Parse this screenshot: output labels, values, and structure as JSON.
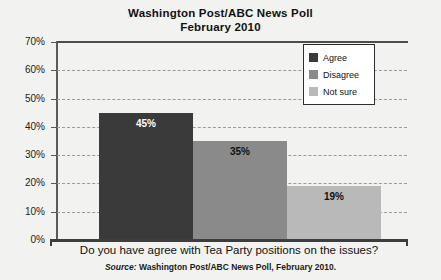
{
  "chart_data": {
    "type": "bar",
    "title": "Washington Post/ABC News Poll",
    "subtitle": "February 2010",
    "categories": [
      "Agree",
      "Disagree",
      "Not sure"
    ],
    "values": [
      45,
      35,
      19
    ],
    "value_labels": [
      "45%",
      "35%",
      "19%"
    ],
    "xlabel": "Do you have agree with Tea Party positions on the issues?",
    "ylabel": "",
    "ylim": [
      0,
      70
    ],
    "ytick_labels": [
      "70%",
      "60%",
      "50%",
      "40%",
      "30%",
      "20%",
      "10%",
      "0%"
    ],
    "ytick_values": [
      70,
      60,
      50,
      40,
      30,
      20,
      10,
      0
    ],
    "grid": "horizontal-dashed",
    "legend_position": "top-right",
    "series_colors": [
      "#3a3a3a",
      "#8a8a8a",
      "#b9b9b9"
    ],
    "source_prefix": "Source:",
    "source_text": "Washington Post/ABC News Poll, February 2010."
  },
  "legend": {
    "items": [
      {
        "label": "Agree",
        "color": "#3a3a3a"
      },
      {
        "label": "Disagree",
        "color": "#8a8a8a"
      },
      {
        "label": "Not sure",
        "color": "#b9b9b9"
      }
    ]
  }
}
